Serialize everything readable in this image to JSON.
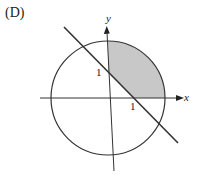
{
  "figure": {
    "option_label": "(D)",
    "axes": {
      "x_label": "x",
      "y_label": "y"
    },
    "tick_labels": {
      "x_intercept": "1",
      "y_intercept": "1"
    },
    "circle": {
      "center": [
        0,
        0
      ],
      "radius_units": 2.2
    },
    "line": {
      "equation": "x + y = 1",
      "slope": -1,
      "intercept": 1
    },
    "shaded_region": "inside circle, above line x + y = 1, in first quadrant (x >= 0, y >= 0)",
    "colors": {
      "stroke": "#333333",
      "shade": "#c8c8c8",
      "background": "#ffffff"
    }
  }
}
